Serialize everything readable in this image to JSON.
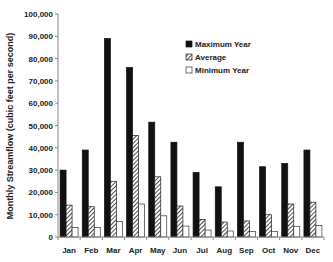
{
  "chart_data": {
    "type": "bar",
    "title": "",
    "xlabel": "",
    "ylabel": "Monthly Streamflow (cubic feet per second)",
    "ylim": [
      0,
      100000
    ],
    "yticks": [
      0,
      10000,
      20000,
      30000,
      40000,
      50000,
      60000,
      70000,
      80000,
      90000,
      100000
    ],
    "ytick_labels": [
      "0",
      "10,000",
      "20,000",
      "30,000",
      "40,000",
      "50,000",
      "60,000",
      "70,000",
      "80,000",
      "90,000",
      "100,000"
    ],
    "grid": false,
    "legend_position": "upper right",
    "categories": [
      "Jan",
      "Feb",
      "Mar",
      "Apr",
      "May",
      "Jun",
      "Jul",
      "Aug",
      "Sep",
      "Oct",
      "Nov",
      "Dec"
    ],
    "series": [
      {
        "name": "Maximum Year",
        "style": "solid-black",
        "values": [
          30000,
          39000,
          89000,
          76000,
          51500,
          42500,
          29000,
          22500,
          42500,
          31500,
          33000,
          39000
        ]
      },
      {
        "name": "Average",
        "style": "hatched",
        "values": [
          14300,
          13600,
          25000,
          45500,
          27000,
          13900,
          7900,
          6700,
          7200,
          10000,
          14800,
          15600
        ]
      },
      {
        "name": "Minimum Year",
        "style": "white",
        "values": [
          4200,
          4300,
          6900,
          14800,
          9500,
          4900,
          3100,
          2700,
          2400,
          2400,
          4800,
          5200
        ]
      }
    ]
  },
  "colors": {
    "max": "#111111",
    "avg_stroke": "#222222",
    "min_fill": "#ffffff",
    "axis": "#888888"
  }
}
